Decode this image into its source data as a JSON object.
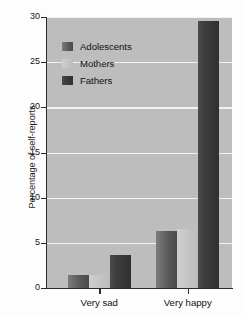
{
  "chart_data": {
    "type": "bar",
    "title": "",
    "subtitle": "",
    "xlabel": "",
    "ylabel": "Percentage of self-reports",
    "categories": [
      "Very sad",
      "Very happy"
    ],
    "series": [
      {
        "name": "Adolescents",
        "values": [
          1.4,
          6.3
        ],
        "color": "#5a5a5a"
      },
      {
        "name": "Mothers",
        "values": [
          1.4,
          6.5
        ],
        "color": "#c6c6c6"
      },
      {
        "name": "Fathers",
        "values": [
          3.6,
          29.6
        ],
        "color": "#383838"
      }
    ],
    "ylim": [
      0,
      30
    ],
    "yticks": [
      0,
      5,
      10,
      15,
      20,
      25,
      30
    ],
    "ytick_labels": [
      "0",
      "5",
      "10",
      "15",
      "20",
      "25",
      "30"
    ],
    "grid": true,
    "grid_axis": "y",
    "grid_color": "#f2f2f2",
    "legend_position": "upper left",
    "plot_background": "#bdbdbd",
    "figure_background": "#fdfdfd",
    "axis_color": "#2b2b2b"
  },
  "legend": {
    "items": [
      {
        "label": "Adolescents"
      },
      {
        "label": "Mothers"
      },
      {
        "label": "Fathers"
      }
    ]
  }
}
